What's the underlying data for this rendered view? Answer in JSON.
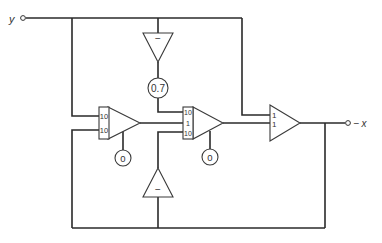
{
  "diagram": {
    "type": "analog computer block diagram",
    "input": {
      "label": "y"
    },
    "output": {
      "label": "− x"
    },
    "components": {
      "inverter_top": {
        "kind": "inverter",
        "sign": "−"
      },
      "coefficient": {
        "kind": "potentiometer",
        "value": "0.7"
      },
      "integrator_1": {
        "kind": "integrator",
        "input_gains": [
          "10",
          "10"
        ],
        "initial_condition": "0"
      },
      "integrator_2": {
        "kind": "integrator",
        "input_gains": [
          "10",
          "1",
          "10"
        ],
        "initial_condition": "0"
      },
      "inverter_bottom": {
        "kind": "inverter",
        "sign": "−"
      },
      "summer": {
        "kind": "summer",
        "input_gains": [
          "1",
          "1"
        ]
      }
    }
  }
}
